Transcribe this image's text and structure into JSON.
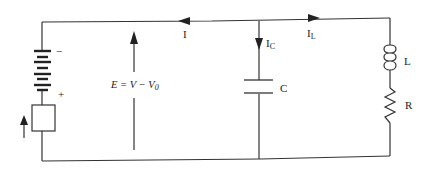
{
  "diagram": {
    "type": "circuit",
    "labels": {
      "current_total": "I",
      "current_capacitor": "I",
      "current_capacitor_sub": "C",
      "current_inductor": "I",
      "current_inductor_sub": "L",
      "capacitor": "C",
      "inductor": "L",
      "resistor": "R",
      "battery_minus": "−",
      "battery_plus": "+",
      "emf_equation_lhs": "E = V − V",
      "emf_equation_sub": "0"
    },
    "colors": {
      "wire": "#333333",
      "background": "#ffffff"
    }
  }
}
